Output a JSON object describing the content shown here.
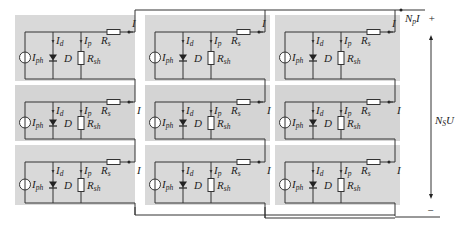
{
  "diagram": {
    "type": "pv-array-circuit",
    "grid": {
      "rows": 3,
      "cols": 3
    },
    "colors": {
      "panel_bg": "#d4d4d4",
      "panel_bg_alt": "#d9d9d9",
      "wire": "#333333",
      "background": "#ffffff"
    },
    "cell_labels": {
      "source": "I",
      "source_sub": "ph",
      "diode_current": "I",
      "diode_current_sub": "d",
      "diode": "D",
      "shunt_current": "I",
      "shunt_current_sub": "p",
      "series_resistor": "R",
      "series_resistor_sub": "s",
      "shunt_resistor": "R",
      "shunt_resistor_sub": "sh",
      "output_current": "I"
    },
    "array_labels": {
      "parallel_current": "N",
      "parallel_current_sub": "p",
      "parallel_current_suffix": "I",
      "plus": "+",
      "minus": "−",
      "voltage": "N",
      "voltage_sub": "S",
      "voltage_suffix": "U"
    }
  }
}
